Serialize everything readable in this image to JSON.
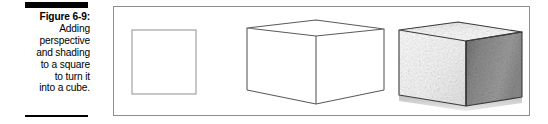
{
  "figure": {
    "label": "Figure 6-9:",
    "caption_lines": [
      "Figure 6-9:",
      "Adding",
      "perspective",
      "and shading",
      "to a square",
      "to turn it",
      "into a cube."
    ],
    "caption_full": "Figure 6-9: Adding perspective and shading to a square to turn it into a cube.",
    "rule_color": "#000000",
    "panel_border_color": "#8d8d8d"
  },
  "illustration": {
    "medium": "pencil drawing",
    "stage_count": 3,
    "stages": [
      {
        "name": "flat-square",
        "description": "A plain flat square outline with no perspective or shading",
        "outline_color": "#9a9a9a"
      },
      {
        "name": "perspective-cube-wireframe",
        "description": "A cube drawn in two-point perspective as a wireframe outline, no shading",
        "outline_color": "#5b5b5b"
      },
      {
        "name": "shaded-cube",
        "description": "The same perspective cube with tonal shading: light top face, light front face, dark hatched right face",
        "outline_color": "#3a3a3a",
        "face_tones": {
          "top": "#f6f6f6",
          "front": "#f1f1f1",
          "right": "#8f8f8f"
        }
      }
    ]
  }
}
